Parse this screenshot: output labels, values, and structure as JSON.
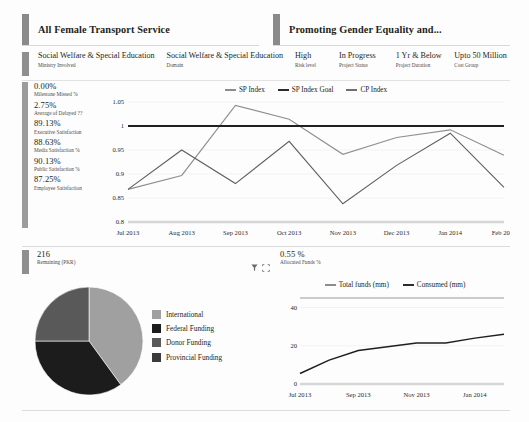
{
  "header": {
    "left_title": "All Female Transport Service",
    "right_title": "Promoting Gender Equality and..."
  },
  "meta": [
    {
      "value": "Social Welfare & Special Education",
      "label": "Ministry Involved"
    },
    {
      "value": "Social Welfare & Special Education",
      "label": "Domain"
    },
    {
      "value": "High",
      "label": "Risk level"
    },
    {
      "value": "In Progress",
      "label": "Project Status"
    },
    {
      "value": "1 Yr & Below",
      "label": "Project Duration"
    },
    {
      "value": "Upto 50 Million",
      "label": "Cost Group"
    }
  ],
  "kpis": [
    {
      "value": "0.00%",
      "label": "Milestone Missed %"
    },
    {
      "value": "2.75%",
      "label": "Average of Delayed ??"
    },
    {
      "value": "89.13%",
      "label": "Executive Satisfaction"
    },
    {
      "value": "88.63%",
      "label": "Media Satisfaction %"
    },
    {
      "value": "90.13%",
      "label": "Public Satisfaction %"
    },
    {
      "value": "87.25%",
      "label": "Employee Satisfaction"
    }
  ],
  "bottom_meta": {
    "remaining_value": "216",
    "remaining_label": "Remaining (PKR)",
    "allocated_value": "0.55 %",
    "allocated_label": "Allocated Funds %",
    "filter_icon": "filter-funnel-icon",
    "focus_icon": "focus-expand-icon"
  },
  "chart_data": [
    {
      "type": "line",
      "title": "",
      "xlabel": "",
      "ylabel": "",
      "grid": true,
      "legend_position": "top",
      "categories": [
        "Jul 2013",
        "Aug 2013",
        "Sep 2013",
        "Oct 2013",
        "Nov 2013",
        "Dec 2013",
        "Jan 2014",
        "Feb 2014"
      ],
      "ylim": [
        0.8,
        1.05
      ],
      "yticks": [
        "0.8",
        "0.85",
        "0.9",
        "0.95",
        "1",
        "1.05"
      ],
      "series": [
        {
          "name": "SP Index",
          "values": [
            0.868,
            0.897,
            1.043,
            1.014,
            0.941,
            0.976,
            0.992,
            0.939
          ]
        },
        {
          "name": "SP Index Goal",
          "values": [
            1,
            1,
            1,
            1,
            1,
            1,
            1,
            1
          ]
        },
        {
          "name": "CP Index",
          "values": [
            0.868,
            0.95,
            0.88,
            0.968,
            0.838,
            0.918,
            0.985,
            0.872
          ]
        }
      ]
    },
    {
      "type": "pie",
      "title": "",
      "legend_position": "right",
      "labels": [
        "International",
        "Federal Funding",
        "Donor Funding",
        "Provincial Funding"
      ],
      "values": [
        40,
        35,
        25,
        0
      ],
      "colors": [
        "#a0a0a0",
        "#1c1c1c",
        "#595959",
        "#3b3b3b"
      ]
    },
    {
      "type": "line",
      "title": "",
      "xlabel": "",
      "ylabel": "",
      "grid": true,
      "legend_position": "top",
      "categories": [
        "Jul 2013",
        "Aug 2013",
        "Sep 2013",
        "Oct 2013",
        "Nov 2013",
        "Dec 2013",
        "Jan 2014",
        "Feb 2014"
      ],
      "xticks": [
        "Jul 2013",
        "Sep 2013",
        "Nov 2013",
        "Jan 2014"
      ],
      "ylim": [
        0,
        45
      ],
      "yticks": [
        "0",
        "20",
        "40"
      ],
      "series": [
        {
          "name": "Total funds (mm)",
          "values": [
            45,
            45,
            45,
            45,
            45,
            45,
            45,
            45
          ]
        },
        {
          "name": "Consumed (mm)",
          "values": [
            5.5,
            12.5,
            17.5,
            19.5,
            21.5,
            21.5,
            24,
            26
          ]
        }
      ]
    }
  ]
}
